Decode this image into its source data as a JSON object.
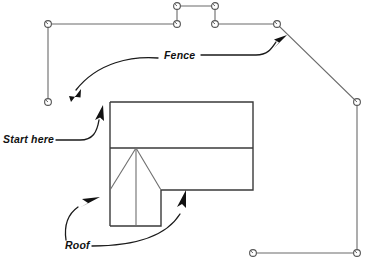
{
  "figure": {
    "type": "technical-line-diagram",
    "background_color": "#ffffff"
  },
  "labels": {
    "fence": "Fence",
    "start_here": "Start here",
    "roof": "Roof",
    "caption": ""
  },
  "colors": {
    "fence_stroke": "#6b6b6b",
    "house_stroke": "#3a3a3a",
    "roof_stroke": "#6e6e6e",
    "leader_stroke": "#1a1a1a",
    "arrow_fill": "#111111",
    "post_fill": "#ffffff",
    "post_stroke": "#555555",
    "text_fill": "#111111"
  },
  "fence": {
    "name": "fence-polyline",
    "description": "Open fence run starting at lower-left, up the left side, across the top with a rectangular notch, down a diagonal on the right, then down the right side and across the bottom.",
    "posts": [
      {
        "id": "p1",
        "x": 48,
        "y": 102,
        "label": "start-post"
      },
      {
        "id": "p2",
        "x": 48,
        "y": 24
      },
      {
        "id": "p3",
        "x": 177,
        "y": 24
      },
      {
        "id": "p4",
        "x": 177,
        "y": 6
      },
      {
        "id": "p5",
        "x": 215,
        "y": 6
      },
      {
        "id": "p6",
        "x": 215,
        "y": 24
      },
      {
        "id": "p7",
        "x": 277,
        "y": 24
      },
      {
        "id": "p8",
        "x": 357,
        "y": 102
      },
      {
        "id": "p9",
        "x": 357,
        "y": 253
      },
      {
        "id": "p10",
        "x": 253,
        "y": 253
      }
    ],
    "segments": [
      {
        "from": "p1",
        "to": "p2",
        "kind": "vertical"
      },
      {
        "from": "p2",
        "to": "p3",
        "kind": "horizontal"
      },
      {
        "from": "p3",
        "to": "p4",
        "kind": "vertical"
      },
      {
        "from": "p4",
        "to": "p5",
        "kind": "horizontal"
      },
      {
        "from": "p5",
        "to": "p6",
        "kind": "vertical"
      },
      {
        "from": "p6",
        "to": "p7",
        "kind": "horizontal"
      },
      {
        "from": "p7",
        "to": "p8",
        "kind": "diagonal"
      },
      {
        "from": "p8",
        "to": "p9",
        "kind": "vertical"
      },
      {
        "from": "p9",
        "to": "p10",
        "kind": "horizontal"
      }
    ]
  },
  "house": {
    "name": "house-outline",
    "main_block": {
      "x": 110,
      "y": 102,
      "width": 143,
      "height": 88
    },
    "divider_line": {
      "x1": 110,
      "y1": 148,
      "x2": 253,
      "y2": 148
    },
    "lower_wing": {
      "x": 110,
      "y": 190,
      "width": 51,
      "height": 36
    },
    "right_bottom_edge": {
      "x1": 161,
      "y1": 190,
      "x2": 253,
      "y2": 190
    }
  },
  "roof": {
    "name": "roof-hip-lines",
    "apex": {
      "x": 136,
      "y": 148
    },
    "ridge": {
      "x1": 136,
      "y1": 148,
      "x2": 136,
      "y2": 226
    },
    "hip_left": {
      "x1": 136,
      "y1": 148,
      "x2": 110,
      "y2": 190
    },
    "hip_right": {
      "x1": 136,
      "y1": 148,
      "x2": 161,
      "y2": 190
    }
  },
  "annotations": [
    {
      "name": "fence-callout",
      "label_key": "fence",
      "text_x": 164,
      "text_y": 60,
      "leaders": [
        {
          "name": "fence-leader-left",
          "target": {
            "x": 70,
            "y": 101
          },
          "direction": "down-left"
        },
        {
          "name": "fence-leader-right",
          "target": {
            "x": 287,
            "y": 36
          },
          "direction": "up-right"
        }
      ]
    },
    {
      "name": "start-here-callout",
      "label_key": "start_here",
      "text_x": 3,
      "text_y": 143,
      "leaders": [
        {
          "name": "start-here-leader",
          "target": {
            "x": 103,
            "y": 106
          },
          "direction": "up-right"
        }
      ]
    },
    {
      "name": "roof-callout",
      "label_key": "roof",
      "text_x": 65,
      "text_y": 249,
      "leaders": [
        {
          "name": "roof-leader-left",
          "target": {
            "x": 100,
            "y": 196
          },
          "direction": "up-right"
        },
        {
          "name": "roof-leader-right",
          "target": {
            "x": 186,
            "y": 191
          },
          "direction": "up"
        }
      ]
    }
  ]
}
